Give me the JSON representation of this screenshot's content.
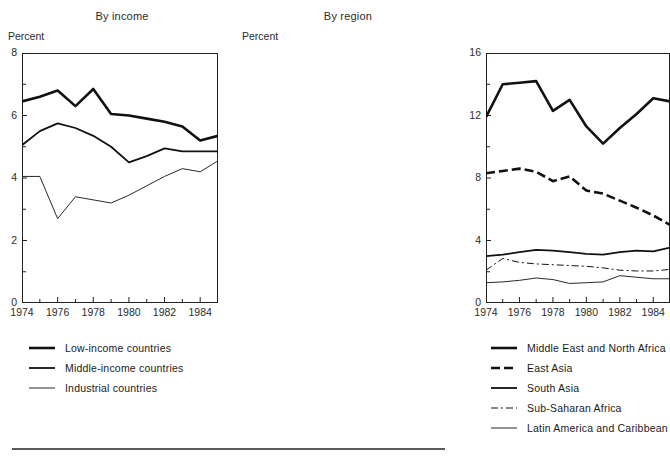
{
  "figure": {
    "bottom_rule": "horizontal-rule",
    "ink_color": "#111111"
  },
  "panels": [
    {
      "id": "income",
      "title": "By income",
      "y_axis_label": "Percent",
      "x_tick_labels": [
        "1974",
        "1976",
        "1978",
        "1980",
        "1982",
        "1984"
      ],
      "y_tick_labels": [
        "0",
        "2",
        "4",
        "6",
        "8"
      ],
      "legend": [
        {
          "label": "Low-income countries",
          "style": "thick-solid"
        },
        {
          "label": "Middle-income countries",
          "style": "medium-solid"
        },
        {
          "label": "Industrial countries",
          "style": "thin-solid"
        }
      ]
    },
    {
      "id": "region",
      "title": "By region",
      "y_axis_label": "Percent",
      "x_tick_labels": [
        "1974",
        "1976",
        "1978",
        "1980",
        "1982",
        "1984"
      ],
      "y_tick_labels": [
        "0",
        "4",
        "8",
        "12",
        "16"
      ],
      "legend": [
        {
          "label": "Middle East and North Africa",
          "style": "thick-solid"
        },
        {
          "label": "East Asia",
          "style": "thick-dashed"
        },
        {
          "label": "South Asia",
          "style": "medium-solid"
        },
        {
          "label": "Sub-Saharan Africa",
          "style": "thin-dashdot"
        },
        {
          "label": "Latin America and Caribbean",
          "style": "thin-solid"
        }
      ]
    }
  ],
  "chart_data": [
    {
      "type": "line",
      "title": "By income",
      "xlabel": "",
      "ylabel": "Percent",
      "xlim": [
        1974,
        1985
      ],
      "ylim": [
        0,
        8
      ],
      "yticks": [
        0,
        2,
        4,
        6,
        8
      ],
      "xticks": [
        1974,
        1976,
        1978,
        1980,
        1982,
        1984
      ],
      "grid": false,
      "legend_position": "below",
      "x": [
        1974,
        1975,
        1976,
        1977,
        1978,
        1979,
        1980,
        1981,
        1982,
        1983,
        1984,
        1985
      ],
      "series": [
        {
          "name": "Low-income countries",
          "style": "thick-solid",
          "values": [
            6.45,
            6.6,
            6.8,
            6.3,
            6.85,
            6.05,
            6.0,
            5.9,
            5.8,
            5.65,
            5.2,
            5.35
          ]
        },
        {
          "name": "Middle-income countries",
          "style": "medium-solid",
          "values": [
            5.05,
            5.5,
            5.75,
            5.6,
            5.35,
            5.0,
            4.5,
            4.7,
            4.95,
            4.85,
            4.85,
            4.85
          ]
        },
        {
          "name": "Industrial countries",
          "style": "thin-solid",
          "values": [
            4.05,
            4.05,
            2.7,
            3.4,
            3.3,
            3.2,
            3.45,
            3.75,
            4.05,
            4.3,
            4.2,
            4.55
          ]
        }
      ]
    },
    {
      "type": "line",
      "title": "By region",
      "xlabel": "",
      "ylabel": "Percent",
      "xlim": [
        1974,
        1985
      ],
      "ylim": [
        0,
        16
      ],
      "yticks": [
        0,
        4,
        8,
        12,
        16
      ],
      "xticks": [
        1974,
        1976,
        1978,
        1980,
        1982,
        1984
      ],
      "grid": false,
      "legend_position": "below",
      "x": [
        1974,
        1975,
        1976,
        1977,
        1978,
        1979,
        1980,
        1981,
        1982,
        1983,
        1984,
        1985
      ],
      "series": [
        {
          "name": "Middle East and North Africa",
          "style": "thick-solid",
          "values": [
            11.9,
            14.0,
            14.1,
            14.2,
            12.3,
            13.0,
            11.3,
            10.2,
            11.2,
            12.1,
            13.1,
            12.9
          ]
        },
        {
          "name": "East Asia",
          "style": "thick-dashed",
          "values": [
            8.3,
            8.45,
            8.6,
            8.4,
            7.8,
            8.1,
            7.2,
            7.0,
            6.55,
            6.1,
            5.6,
            5.0
          ]
        },
        {
          "name": "South Asia",
          "style": "medium-solid",
          "values": [
            3.0,
            3.1,
            3.25,
            3.4,
            3.35,
            3.25,
            3.15,
            3.1,
            3.25,
            3.35,
            3.3,
            3.55
          ]
        },
        {
          "name": "Sub-Saharan Africa",
          "style": "thin-dashdot",
          "values": [
            2.1,
            2.85,
            2.6,
            2.5,
            2.45,
            2.4,
            2.35,
            2.25,
            2.1,
            2.05,
            2.05,
            2.15
          ]
        },
        {
          "name": "Latin America and Caribbean",
          "style": "thin-solid",
          "values": [
            1.3,
            1.35,
            1.45,
            1.6,
            1.5,
            1.25,
            1.3,
            1.35,
            1.75,
            1.65,
            1.55,
            1.55
          ]
        }
      ]
    }
  ]
}
